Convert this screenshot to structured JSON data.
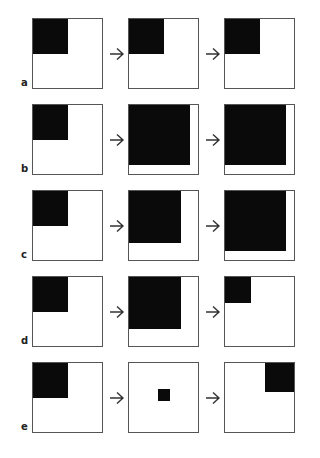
{
  "figure": {
    "rows": [
      {
        "label": "a",
        "panels": [
          {
            "fill": {
              "anchor": "top-left",
              "w": 0.5,
              "h": 0.5
            }
          },
          {
            "fill": {
              "anchor": "top-left",
              "w": 0.5,
              "h": 0.5
            }
          },
          {
            "fill": {
              "anchor": "top-left",
              "w": 0.5,
              "h": 0.5
            }
          }
        ]
      },
      {
        "label": "b",
        "panels": [
          {
            "fill": {
              "anchor": "top-left",
              "w": 0.5,
              "h": 0.5
            }
          },
          {
            "fill": {
              "anchor": "top-left",
              "w": 0.88,
              "h": 0.87
            }
          },
          {
            "fill": {
              "anchor": "top-left",
              "w": 0.88,
              "h": 0.87
            }
          }
        ]
      },
      {
        "label": "c",
        "panels": [
          {
            "fill": {
              "anchor": "top-left",
              "w": 0.5,
              "h": 0.5
            }
          },
          {
            "fill": {
              "anchor": "top-left",
              "w": 0.75,
              "h": 0.75
            }
          },
          {
            "fill": {
              "anchor": "top-left",
              "w": 0.88,
              "h": 0.87
            }
          }
        ]
      },
      {
        "label": "d",
        "panels": [
          {
            "fill": {
              "anchor": "top-left",
              "w": 0.5,
              "h": 0.5
            }
          },
          {
            "fill": {
              "anchor": "top-left",
              "w": 0.75,
              "h": 0.75
            }
          },
          {
            "fill": {
              "anchor": "top-left",
              "w": 0.37,
              "h": 0.37
            }
          }
        ]
      },
      {
        "label": "e",
        "panels": [
          {
            "fill": {
              "anchor": "top-left",
              "w": 0.5,
              "h": 0.5
            }
          },
          {
            "fill": {
              "anchor": "center",
              "w": 0.17,
              "h": 0.17
            }
          },
          {
            "fill": {
              "anchor": "top-right",
              "w": 0.42,
              "h": 0.42
            }
          }
        ]
      }
    ],
    "arrow_glyph": "→",
    "colors": {
      "fill": "#0a0a0a",
      "border": "#555555",
      "background": "#ffffff"
    }
  }
}
